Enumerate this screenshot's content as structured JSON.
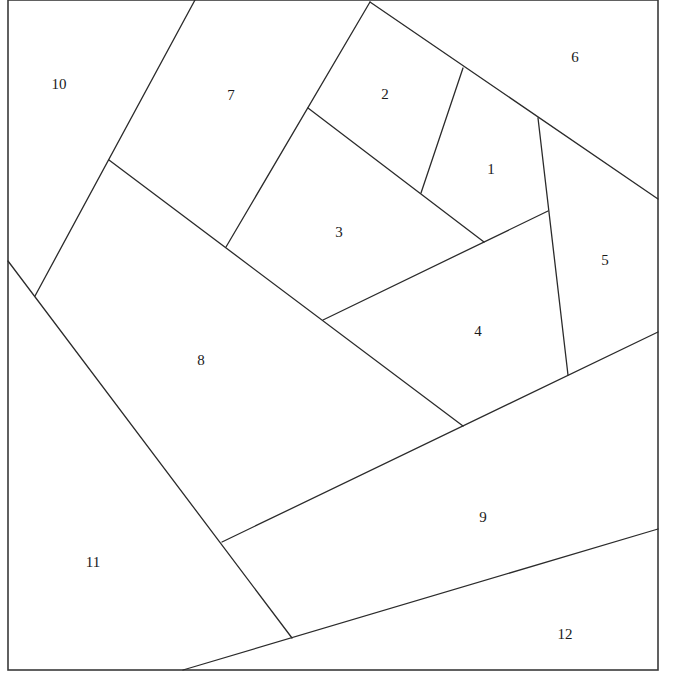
{
  "diagram": {
    "type": "foundation-paper-piecing-pattern",
    "stroke_color": "#2b2b2b",
    "background": "#ffffff",
    "border": {
      "x1": 8,
      "y1": 0,
      "x2": 658,
      "y2": 670
    },
    "seams": [
      {
        "id": "seam-7-10",
        "x1": 195,
        "y1": 0,
        "x2": 35,
        "y2": 296
      },
      {
        "id": "seam-7-2-3",
        "x1": 370,
        "y1": 2,
        "x2": 226,
        "y2": 247
      },
      {
        "id": "seam-6-2-1-5",
        "x1": 370,
        "y1": 2,
        "x2": 658,
        "y2": 199
      },
      {
        "id": "seam-2-1",
        "x1": 463,
        "y1": 68,
        "x2": 421,
        "y2": 193
      },
      {
        "id": "seam-2-1-3",
        "x1": 308,
        "y1": 108,
        "x2": 484,
        "y2": 242
      },
      {
        "id": "seam-1-4-5",
        "x1": 538,
        "y1": 118,
        "x2": 568,
        "y2": 375
      },
      {
        "id": "seam-3-4",
        "x1": 323,
        "y1": 320,
        "x2": 548,
        "y2": 211
      },
      {
        "id": "seam-7-3-4-8",
        "x1": 109,
        "y1": 160,
        "x2": 463,
        "y2": 426
      },
      {
        "id": "seam-8-4-5-9",
        "x1": 222,
        "y1": 542,
        "x2": 658,
        "y2": 332
      },
      {
        "id": "seam-10-8-9-11",
        "x1": 8,
        "y1": 261,
        "x2": 292,
        "y2": 638
      },
      {
        "id": "seam-9-11-12",
        "x1": 183,
        "y1": 670,
        "x2": 658,
        "y2": 529
      }
    ],
    "pieces": [
      {
        "label": "1",
        "x": 491,
        "y": 171
      },
      {
        "label": "2",
        "x": 385,
        "y": 96
      },
      {
        "label": "3",
        "x": 339,
        "y": 234
      },
      {
        "label": "4",
        "x": 478,
        "y": 333
      },
      {
        "label": "5",
        "x": 605,
        "y": 262
      },
      {
        "label": "6",
        "x": 575,
        "y": 59
      },
      {
        "label": "7",
        "x": 231,
        "y": 97
      },
      {
        "label": "8",
        "x": 201,
        "y": 362
      },
      {
        "label": "9",
        "x": 483,
        "y": 519
      },
      {
        "label": "10",
        "x": 59,
        "y": 86
      },
      {
        "label": "11",
        "x": 93,
        "y": 564
      },
      {
        "label": "12",
        "x": 565,
        "y": 636
      }
    ]
  }
}
